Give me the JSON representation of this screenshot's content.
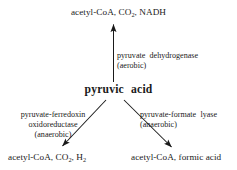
{
  "diagram": {
    "background_color": "#ffffff",
    "stroke_color": "#1a1a1a",
    "center": {
      "label": "pyruvic acid",
      "word_1": "pyruvic",
      "word_2": "acid"
    },
    "branches": [
      {
        "id": "aerobic",
        "direction": "up",
        "enzyme_line_1": "pyruvate dehydrogenase",
        "enzyme_line_2": "(aerobic)",
        "enzyme_word_1": "pyruvate",
        "enzyme_word_2": "dehydrogenase",
        "condition": "(aerobic)",
        "product_prefix": "acetyl-CoA, CO",
        "product_sub": "2",
        "product_suffix": ", NADH",
        "product_full": "acetyl-CoA, CO2, NADH"
      },
      {
        "id": "anaerobic-ferredoxin",
        "direction": "down-left",
        "enzyme_line_1": "pyruvate-ferredoxin",
        "enzyme_line_2": "oxidoreductase",
        "enzyme_line_3": "(anaerobic)",
        "condition": "(anaerobic)",
        "product_prefix": "acetyl-CoA, CO",
        "product_sub": "2",
        "product_mid": ", H",
        "product_sub2": "2",
        "product_full": "acetyl-CoA, CO2, H2"
      },
      {
        "id": "anaerobic-formate",
        "direction": "down-right",
        "enzyme_line_1": "pyruvate-formate lyase",
        "enzyme_word_1": "pyruvate-formate",
        "enzyme_word_2": "lyase",
        "enzyme_line_2": "(anaerobic)",
        "condition": "(anaerobic)",
        "product_full": "acetyl-CoA, formic acid"
      }
    ]
  }
}
